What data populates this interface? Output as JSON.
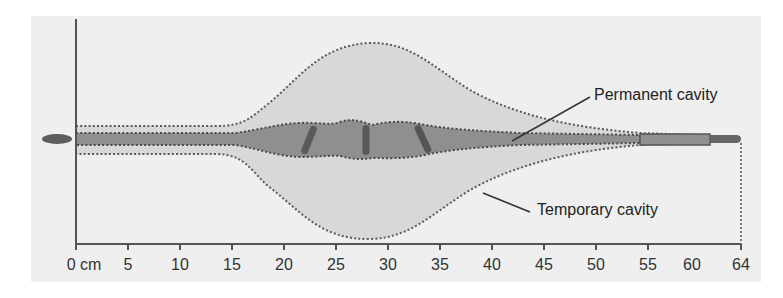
{
  "diagram": {
    "labels": {
      "permanent": "Permanent cavity",
      "temporary": "Temporary cavity"
    },
    "axis": {
      "unit_label": "0 cm",
      "ticks": [
        "5",
        "10",
        "15",
        "20",
        "25",
        "30",
        "35",
        "40",
        "45",
        "50",
        "55",
        "60",
        "64"
      ]
    },
    "colors": {
      "panel_bg": "#efefef",
      "temporary_fill": "#d8d8d8",
      "permanent_fill": "#8f8f8f",
      "outline_dots": "#555555",
      "axis": "#555555"
    }
  }
}
